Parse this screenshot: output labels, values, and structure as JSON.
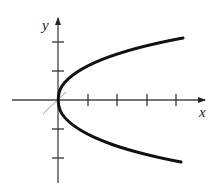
{
  "figure": {
    "type": "graph",
    "axes": {
      "x_label": "x",
      "y_label": "y",
      "x_ticks_positive": 4,
      "y_ticks_positive": 2,
      "y_ticks_negative": 2
    },
    "curve": {
      "shape": "parabola",
      "orientation": "opens-right",
      "vertex": [
        0,
        0
      ]
    },
    "colors": {
      "axis": "#333333",
      "curve": "#111111",
      "guide_line": "#9a9a9a",
      "background": "#ffffff"
    }
  }
}
